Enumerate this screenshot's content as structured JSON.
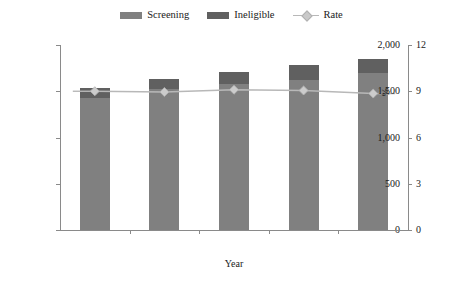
{
  "legend": {
    "items": [
      {
        "label": "Screening",
        "type": "swatch",
        "color": "#808080",
        "icon": "legend-swatch-icon"
      },
      {
        "label": "Ineligible",
        "type": "swatch",
        "color": "#606060",
        "icon": "legend-swatch-icon"
      },
      {
        "label": "Rate",
        "type": "line",
        "color": "#b8b8b8",
        "icon": "legend-line-marker-icon"
      }
    ]
  },
  "axes": {
    "left": {
      "title": "10,000 Donations",
      "ticks": [
        "0",
        "500",
        "1,000",
        "1,500",
        "2,000"
      ],
      "min": 0,
      "max": 2000
    },
    "right": {
      "title": "%",
      "ticks": [
        "0",
        "3",
        "6",
        "9",
        "12"
      ],
      "min": 0,
      "max": 12
    },
    "bottom": {
      "title": "Year",
      "ticks": [
        "2015",
        "2016",
        "2017",
        "2018",
        "2019"
      ]
    }
  },
  "chart_data": {
    "type": "bar",
    "title": "",
    "xlabel": "Year",
    "ylabel": "10,000 Donations",
    "y2label": "%",
    "categories": [
      "2015",
      "2016",
      "2017",
      "2018",
      "2019"
    ],
    "ylim": [
      0,
      2000
    ],
    "y2lim": [
      0,
      12
    ],
    "grid": false,
    "legend_position": "top-center",
    "stacked": true,
    "series": [
      {
        "name": "Screening",
        "type": "bar",
        "axis": "left",
        "color": "#808080",
        "values": [
          1430,
          1525,
          1580,
          1620,
          1700
        ]
      },
      {
        "name": "Ineligible",
        "type": "bar",
        "axis": "left",
        "color": "#606060",
        "values": [
          100,
          105,
          130,
          160,
          150
        ]
      },
      {
        "name": "Rate",
        "type": "line",
        "axis": "right",
        "color": "#b8b8b8",
        "values": [
          9.0,
          8.95,
          9.1,
          9.05,
          8.85
        ]
      }
    ],
    "totals": [
      1530,
      1630,
      1710,
      1780,
      1850
    ]
  }
}
